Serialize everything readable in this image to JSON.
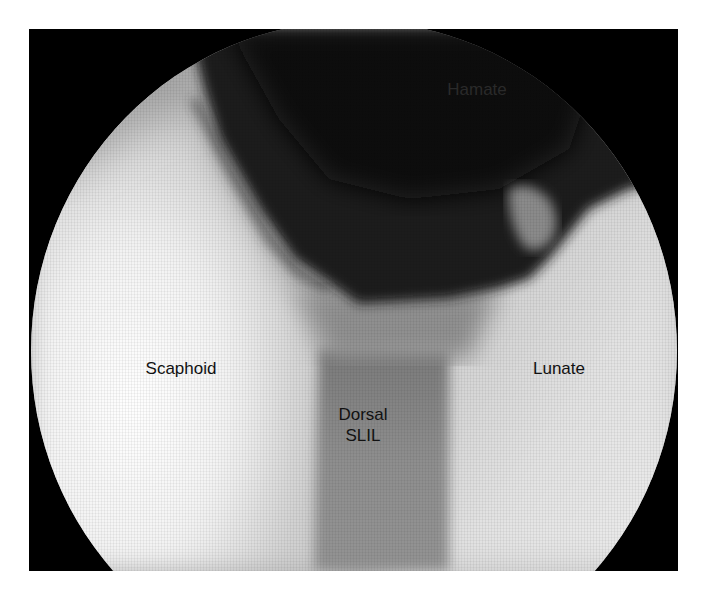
{
  "figure": {
    "type": "arthroscopic-view",
    "frame_color": "#000000",
    "page_background": "#ffffff",
    "labels": {
      "hamate": "Hamate",
      "scaphoid": "Scaphoid",
      "lunate": "Lunate",
      "dorsal_slil": "Dorsal\nSLIL"
    },
    "tones": {
      "dark_cavity": "#1a1a1a",
      "scaphoid_bright": "#f4f4f4",
      "lunate_light": "#d8d8d8",
      "ligament_mid": "#8a8a8a"
    }
  }
}
